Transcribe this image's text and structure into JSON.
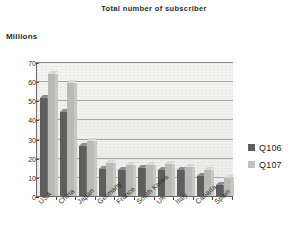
{
  "chart_data": {
    "type": "bar",
    "title": "Total number of subscriber",
    "xlabel": "",
    "ylabel": "Millions",
    "ylim": [
      0,
      70
    ],
    "yticks": [
      0,
      10,
      20,
      30,
      40,
      50,
      60,
      70
    ],
    "grid": true,
    "legend_position": "right",
    "categories": [
      "USA",
      "China",
      "Japan",
      "Germany",
      "France",
      "South Korea",
      "UK",
      "Italy",
      "Canada",
      "Spain"
    ],
    "series": [
      {
        "name": "Q106",
        "color": "#5e5e5e",
        "values": [
          51,
          44,
          26,
          14,
          13.5,
          14.5,
          13.5,
          13.5,
          10.5,
          6
        ]
      },
      {
        "name": "Q107",
        "color": "#c2c2bf",
        "values": [
          64,
          59,
          28.5,
          17,
          16,
          16,
          16.5,
          15,
          13.5,
          9.5
        ]
      }
    ]
  },
  "legend": {
    "items": [
      {
        "label": "Q106"
      },
      {
        "label": "Q107"
      }
    ]
  }
}
